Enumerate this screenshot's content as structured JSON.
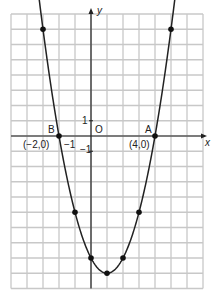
{
  "chart_data": {
    "type": "line",
    "title": "",
    "xlabel": "x",
    "ylabel": "y",
    "xlim": [
      -5,
      7
    ],
    "ylim": [
      -10,
      8
    ],
    "grid": true,
    "function": "y = x^2 - 2x - 8",
    "series": [
      {
        "name": "parabola",
        "x": [
          -3,
          -2,
          -1,
          0,
          1,
          2,
          3,
          4,
          5
        ],
        "y": [
          7,
          0,
          -5,
          -8,
          -9,
          -8,
          -5,
          0,
          7
        ]
      }
    ],
    "annotations": [
      {
        "text": "B",
        "x": -2,
        "y": 0,
        "coord_label": "(−2,0)"
      },
      {
        "text": "A",
        "x": 4,
        "y": 0,
        "coord_label": "(4,0)"
      },
      {
        "text": "O",
        "x": 0,
        "y": 0
      }
    ],
    "tick_labels": {
      "x": [
        "-1"
      ],
      "y": [
        "1",
        "-1"
      ]
    }
  },
  "labels": {
    "x_axis": "x",
    "y_axis": "y",
    "origin": "O",
    "point_a": "A",
    "point_b": "B",
    "point_a_coord": "(4,0)",
    "point_b_coord": "(−2,0)",
    "tick_x_neg1": "−1",
    "tick_y_1": "1",
    "tick_y_neg1": "−1"
  },
  "colors": {
    "grid": "#c8c8c8",
    "axis": "#222222",
    "curve": "#222222",
    "point": "#111111"
  }
}
